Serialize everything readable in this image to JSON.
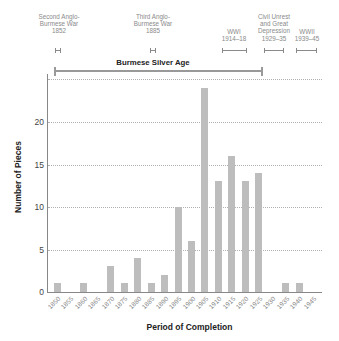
{
  "chart_data": {
    "type": "bar",
    "title": "",
    "xlabel": "Period of Completion",
    "ylabel": "Number of Pieces",
    "ylim": [
      0,
      25
    ],
    "yticks": [
      0,
      5,
      10,
      15,
      20
    ],
    "grid": true,
    "categories": [
      "1850",
      "1855",
      "1860",
      "1865",
      "1870",
      "1875",
      "1880",
      "1885",
      "1890",
      "1895",
      "1900",
      "1905",
      "1910",
      "1915",
      "1920",
      "1925",
      "1930",
      "1935",
      "1940",
      "1945"
    ],
    "values": [
      1,
      0,
      1,
      0,
      3,
      1,
      4,
      1,
      2,
      10,
      6,
      24,
      13,
      16,
      13,
      14,
      0,
      1,
      1,
      0
    ],
    "annotations": [
      {
        "label": "Second Anglo-Burmese War",
        "years": "1852"
      },
      {
        "label": "Third Anglo-Burmese War",
        "years": "1885"
      },
      {
        "label": "WWI",
        "years": "1914–18"
      },
      {
        "label": "Civil Unrest and Great Depression",
        "years": "1929–35"
      },
      {
        "label": "WWII",
        "years": "1939–45"
      }
    ],
    "era": {
      "label": "Burmese Silver Age",
      "start": 1850,
      "end": 1930
    }
  },
  "events": [
    {
      "line1": "Second Anglo-",
      "line2": "Burmese War",
      "line3": "1852"
    },
    {
      "line1": "Third Anglo-",
      "line2": "Burmese War",
      "line3": "1885"
    },
    {
      "line1": "WWI",
      "line2": "1914–18"
    },
    {
      "line1": "Civil Unrest",
      "line2": "and Great",
      "line3": "Depression",
      "line4": "1929–35"
    },
    {
      "line1": "WWII",
      "line2": "1939–45"
    }
  ],
  "era_title": "Burmese Silver Age",
  "axis": {
    "x_label": "Period of Completion",
    "y_label": "Number of Pieces",
    "y_ticks": [
      "0",
      "5",
      "10",
      "15",
      "20"
    ]
  },
  "colors": {
    "bar": "#bdbdbd",
    "annotation": "#8a8a8a",
    "grid": "#b0b0b0"
  }
}
